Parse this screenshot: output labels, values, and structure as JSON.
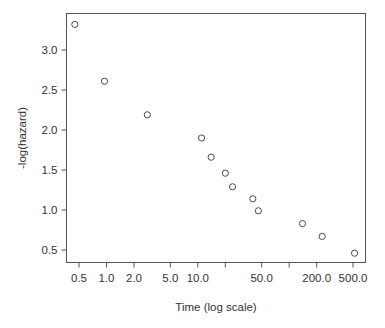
{
  "chart_data": {
    "type": "scatter",
    "title": "",
    "xlabel": "Time (log scale)",
    "ylabel": "-log(hazard)",
    "x_scale": "log",
    "y_scale": "linear",
    "grid": false,
    "legend": null,
    "xlim": [
      0.4,
      620
    ],
    "ylim": [
      0.36,
      3.45
    ],
    "x_ticks": [
      0.5,
      1.0,
      2.0,
      5.0,
      10.0,
      20.0,
      50.0,
      100.0,
      200.0,
      500.0
    ],
    "x_tick_labels": [
      "0.5",
      "1.0",
      "2.0",
      "5.0",
      "10.0",
      "",
      "50.0",
      "",
      "200.0",
      "500.0"
    ],
    "y_ticks": [
      0.5,
      1.0,
      1.5,
      2.0,
      2.5,
      3.0
    ],
    "y_tick_labels": [
      "0.5",
      "1.0",
      "1.5",
      "2.0",
      "2.5",
      "3.0"
    ],
    "marker": "open-circle",
    "marker_color": "#4a4a4a",
    "x": [
      0.45,
      0.95,
      2.8,
      11.0,
      14.0,
      20.0,
      24.0,
      40.0,
      46.0,
      140.0,
      230.0,
      520.0
    ],
    "y": [
      3.32,
      2.61,
      2.19,
      1.9,
      1.66,
      1.46,
      1.29,
      1.14,
      0.99,
      0.83,
      0.67,
      0.46
    ],
    "points": [
      {
        "x": 0.45,
        "y": 3.32
      },
      {
        "x": 0.95,
        "y": 2.61
      },
      {
        "x": 2.8,
        "y": 2.19
      },
      {
        "x": 11.0,
        "y": 1.9
      },
      {
        "x": 14.0,
        "y": 1.66
      },
      {
        "x": 20.0,
        "y": 1.46
      },
      {
        "x": 24.0,
        "y": 1.29
      },
      {
        "x": 40.0,
        "y": 1.14
      },
      {
        "x": 46.0,
        "y": 0.99
      },
      {
        "x": 140.0,
        "y": 0.83
      },
      {
        "x": 230.0,
        "y": 0.67
      },
      {
        "x": 520.0,
        "y": 0.46
      }
    ]
  },
  "axes": {
    "x_title": "Time (log scale)",
    "y_title": "-log(hazard)"
  },
  "colors": {
    "axis": "#555555",
    "text": "#333333",
    "marker": "#4a4a4a",
    "background": "#ffffff"
  }
}
